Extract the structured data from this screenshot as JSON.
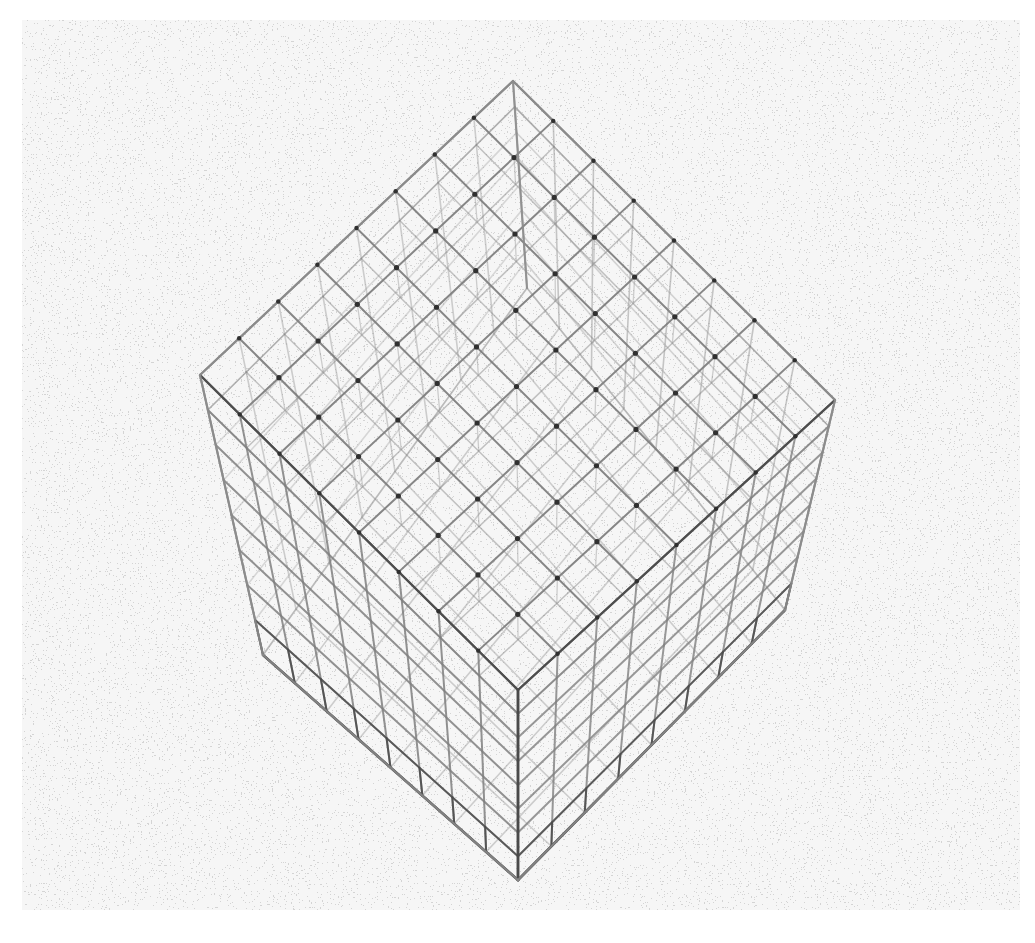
{
  "figure": {
    "title": "",
    "caption": "",
    "background": {
      "kind": "dithered-halftone-noise",
      "page_color": "#ffffff",
      "plate_color": "#f2f2f2",
      "noise_dark": "#a8a8a8",
      "noise_light": "#f4f4f4",
      "plate_rect": {
        "x": 22,
        "y": 20,
        "width": 998,
        "height": 890
      }
    },
    "subject": {
      "name": "wireframe-cube-lattice",
      "description": "Three-dimensional wireframe lattice cube seen in perspective from above a corner",
      "divisions": 8,
      "grid_label": "8 x 8 x 8"
    },
    "colors": {
      "edge_far": "#9a9a9a",
      "edge_mid": "#7f7f7f",
      "edge_near": "#4a4a4a",
      "edge_silhouette": "#8c8c8c",
      "vertex_dot": "#2e2e2e"
    },
    "geometry": {
      "comment": "Screen-space corners of the drawn solid, in plate coordinates (plate origin = 22,20 of page)",
      "top_face": {
        "back": [
          491,
          61
        ],
        "left": [
          178,
          355
        ],
        "right": [
          813,
          380
        ],
        "front": [
          496,
          670
        ]
      },
      "bottom_face": {
        "back": [
          505,
          268
        ],
        "left": [
          241,
          635
        ],
        "right": [
          763,
          590
        ],
        "front": [
          496,
          860
        ]
      },
      "top_divisions_left": 8,
      "top_divisions_right": 8,
      "vertical_divisions": 8
    },
    "line_widths": {
      "far": 1.6,
      "mid": 2.0,
      "near": 2.6,
      "silhouette": 2.2
    },
    "vertex_dot_radius": 2.6
  }
}
